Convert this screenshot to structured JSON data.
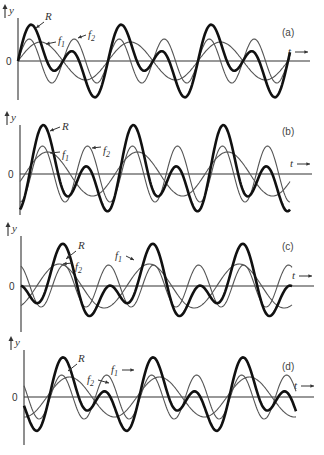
{
  "figure": {
    "y_axis_label": "y",
    "t_axis_label": "t",
    "zero_label": "0",
    "resultant_label": "R",
    "component1_label": "f",
    "component1_sub": "1",
    "component2_label": "f",
    "component2_sub": "2"
  },
  "panels": [
    {
      "id": "a",
      "label": "(a)",
      "axis_x": 18,
      "zero_y": 61,
      "top_y": 4,
      "bottom_y": 100,
      "t_end": 310,
      "curve_end": 290,
      "f1": {
        "amp": 19,
        "period": 90,
        "phase": 0.0
      },
      "f2": {
        "amp": 22,
        "period": 45,
        "phase": 0.0
      },
      "label_pos": [
        282,
        36
      ],
      "t_pos": [
        288,
        55
      ],
      "R_label": [
        45,
        20
      ],
      "f1_label": [
        58,
        44
      ],
      "f2_label": [
        88,
        38
      ],
      "R_arrow": [
        [
          44,
          22
        ],
        [
          36,
          28
        ]
      ],
      "f1_arrow": [
        [
          56,
          42
        ],
        [
          46,
          44
        ]
      ],
      "f2_arrow": [
        [
          86,
          35
        ],
        [
          78,
          38
        ]
      ]
    },
    {
      "id": "b",
      "label": "(b)",
      "axis_x": 20,
      "zero_y": 174,
      "top_y": 111,
      "bottom_y": 215,
      "t_end": 312,
      "curve_end": 290,
      "f1": {
        "amp": 22,
        "period": 90,
        "phase": -0.35
      },
      "f2": {
        "amp": 28,
        "period": 45,
        "phase": -1.5708
      },
      "label_pos": [
        282,
        135
      ],
      "t_pos": [
        290,
        167
      ],
      "R_label": [
        62,
        130
      ],
      "f1_label": [
        62,
        158
      ],
      "f2_label": [
        103,
        154
      ],
      "R_arrow": [
        [
          60,
          127
        ],
        [
          50,
          131
        ]
      ],
      "f1_arrow": [
        [
          60,
          152
        ],
        [
          50,
          153
        ]
      ],
      "f2_arrow": [
        [
          101,
          147
        ],
        [
          92,
          148
        ]
      ]
    },
    {
      "id": "c",
      "label": "(c)",
      "axis_x": 21,
      "zero_y": 286,
      "top_y": 222,
      "bottom_y": 332,
      "t_end": 314,
      "curve_end": 292,
      "f1": {
        "amp": 22,
        "period": 90,
        "phase": -1.1
      },
      "f2": {
        "amp": 21,
        "period": 45,
        "phase": 1.9
      },
      "label_pos": [
        282,
        250
      ],
      "t_pos": [
        292,
        279
      ],
      "R_label": [
        78,
        249
      ],
      "f1_label": [
        115,
        259
      ],
      "f2_label": [
        75,
        270
      ],
      "R_arrow": [
        [
          76,
          251
        ],
        [
          66,
          259
        ]
      ],
      "f1_arrow": [
        [
          126,
          256
        ],
        [
          134,
          260
        ]
      ],
      "f2_arrow": [
        [
          72,
          263
        ],
        [
          63,
          264
        ]
      ]
    },
    {
      "id": "d",
      "label": "(d)",
      "axis_x": 24,
      "zero_y": 397,
      "top_y": 336,
      "bottom_y": 445,
      "t_end": 314,
      "curve_end": 296,
      "f1": {
        "amp": 20,
        "period": 90,
        "phase": -1.6
      },
      "f2": {
        "amp": 22,
        "period": 45,
        "phase": 2.6
      },
      "label_pos": [
        282,
        370
      ],
      "t_pos": [
        294,
        389
      ],
      "R_label": [
        78,
        362
      ],
      "f1_label": [
        111,
        373
      ],
      "f2_label": [
        87,
        383
      ],
      "R_arrow": [
        [
          77,
          364
        ],
        [
          68,
          371
        ]
      ],
      "f1_arrow": [
        [
          122,
          370
        ],
        [
          134,
          370
        ]
      ],
      "f2_arrow": [
        [
          98,
          380
        ],
        [
          109,
          383
        ]
      ]
    }
  ]
}
